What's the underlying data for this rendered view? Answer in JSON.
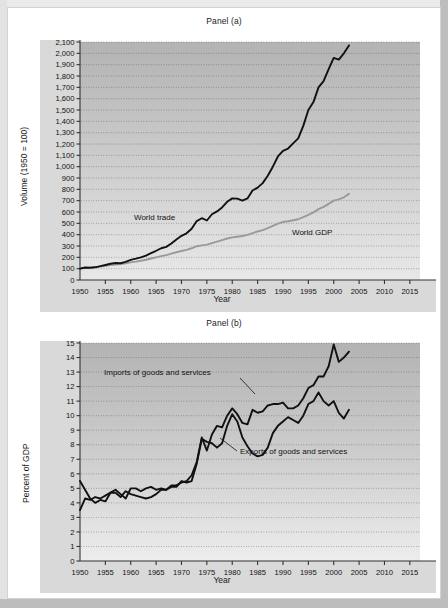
{
  "figure": {
    "background_color": "#ffffff",
    "frame_color": "#c9c9c9"
  },
  "panel_a": {
    "title": "Panel (a)",
    "ylabel": "Volume (1950 = 100)",
    "xlabel": "Year",
    "series_labels": {
      "world_trade": "World trade",
      "world_gdp": "World GDP"
    },
    "colors": {
      "world_trade": "#111111",
      "world_gdp": "#9a9a9a",
      "plot_bg_top": "#b3b3b3",
      "plot_bg_bottom": "#e8e8e8",
      "gridline": "#555555"
    },
    "ytick_labels": [
      "0",
      "100",
      "200",
      "300",
      "400",
      "500",
      "600",
      "700",
      "800",
      "900",
      "1,000",
      "1,100",
      "1,200",
      "1,300",
      "1,400",
      "1,500",
      "1,600",
      "1,700",
      "1,800",
      "1,900",
      "2,000",
      "2,100"
    ],
    "xtick_labels": [
      "1950",
      "1955",
      "1960",
      "1965",
      "1970",
      "1975",
      "1980",
      "1985",
      "1990",
      "1995",
      "2000",
      "2005",
      "2010",
      "2015"
    ]
  },
  "panel_b": {
    "title": "Panel (b)",
    "ylabel": "Percent of GDP",
    "xlabel": "Year",
    "series_labels": {
      "imports": "Imports of goods and services",
      "exports": "Exports of goods and services"
    },
    "colors": {
      "imports": "#111111",
      "exports": "#111111",
      "plot_bg_top": "#b3b3b3",
      "plot_bg_bottom": "#ededed",
      "gridline": "#555555"
    },
    "ytick_labels": [
      "0",
      "1",
      "2",
      "3",
      "4",
      "5",
      "6",
      "7",
      "8",
      "9",
      "10",
      "11",
      "12",
      "13",
      "14",
      "15"
    ],
    "xtick_labels": [
      "1950",
      "1955",
      "1960",
      "1965",
      "1970",
      "1975",
      "1980",
      "1985",
      "1990",
      "1995",
      "2000",
      "2005",
      "2010",
      "2015"
    ]
  },
  "chart_data": [
    {
      "type": "line",
      "id": "panel_a",
      "title": "Panel (a)",
      "xlabel": "Year",
      "ylabel": "Volume (1950 = 100)",
      "xlim": [
        1950,
        2017
      ],
      "ylim": [
        0,
        2100
      ],
      "ytick_step": 100,
      "xtick_step": 5,
      "grid": "horizontal-dotted",
      "legend": "inline-annotations",
      "x": [
        1950,
        1951,
        1952,
        1953,
        1954,
        1955,
        1956,
        1957,
        1958,
        1959,
        1960,
        1961,
        1962,
        1963,
        1964,
        1965,
        1966,
        1967,
        1968,
        1969,
        1970,
        1971,
        1972,
        1973,
        1974,
        1975,
        1976,
        1977,
        1978,
        1979,
        1980,
        1981,
        1982,
        1983,
        1984,
        1985,
        1986,
        1987,
        1988,
        1989,
        1990,
        1991,
        1992,
        1993,
        1994,
        1995,
        1996,
        1997,
        1998,
        1999,
        2000,
        2001,
        2002,
        2003
      ],
      "series": [
        {
          "name": "World trade",
          "color": "#111111",
          "values": [
            100,
            110,
            108,
            112,
            122,
            132,
            143,
            150,
            148,
            160,
            178,
            188,
            200,
            215,
            238,
            258,
            280,
            292,
            322,
            358,
            390,
            412,
            452,
            520,
            545,
            525,
            580,
            605,
            640,
            690,
            720,
            718,
            700,
            720,
            790,
            815,
            855,
            920,
            1000,
            1090,
            1140,
            1160,
            1205,
            1250,
            1360,
            1500,
            1570,
            1700,
            1755,
            1860,
            1960,
            1945,
            2000,
            2070
          ]
        },
        {
          "name": "World GDP",
          "color": "#9a9a9a",
          "values": [
            100,
            105,
            109,
            114,
            118,
            125,
            131,
            136,
            140,
            147,
            155,
            162,
            170,
            179,
            190,
            200,
            211,
            219,
            232,
            245,
            256,
            266,
            280,
            298,
            306,
            312,
            325,
            338,
            352,
            366,
            376,
            382,
            388,
            398,
            414,
            428,
            440,
            457,
            478,
            498,
            512,
            518,
            527,
            536,
            555,
            575,
            597,
            625,
            645,
            672,
            700,
            712,
            730,
            760
          ]
        }
      ]
    },
    {
      "type": "line",
      "id": "panel_b",
      "title": "Panel (b)",
      "xlabel": "Year",
      "ylabel": "Percent of GDP",
      "xlim": [
        1950,
        2017
      ],
      "ylim": [
        0,
        15
      ],
      "ytick_step": 1,
      "xtick_step": 5,
      "grid": "horizontal-dotted",
      "legend": "inline-annotations",
      "x": [
        1950,
        1951,
        1952,
        1953,
        1954,
        1955,
        1956,
        1957,
        1958,
        1959,
        1960,
        1961,
        1962,
        1963,
        1964,
        1965,
        1966,
        1967,
        1968,
        1969,
        1970,
        1971,
        1972,
        1973,
        1974,
        1975,
        1976,
        1977,
        1978,
        1979,
        1980,
        1981,
        1982,
        1983,
        1984,
        1985,
        1986,
        1987,
        1988,
        1989,
        1990,
        1991,
        1992,
        1993,
        1994,
        1995,
        1996,
        1997,
        1998,
        1999,
        2000,
        2001,
        2002,
        2003
      ],
      "series": [
        {
          "name": "Imports of goods and services",
          "color": "#111111",
          "values": [
            3.5,
            4.3,
            4.2,
            4.4,
            4.3,
            4.5,
            4.7,
            4.7,
            4.4,
            4.8,
            4.6,
            4.5,
            4.4,
            4.3,
            4.4,
            4.6,
            4.9,
            4.9,
            5.2,
            5.2,
            5.4,
            5.5,
            5.9,
            6.8,
            8.5,
            7.6,
            8.7,
            9.3,
            9.2,
            10.0,
            10.5,
            10.1,
            9.5,
            9.4,
            10.4,
            10.2,
            10.3,
            10.7,
            10.8,
            10.8,
            10.9,
            10.5,
            10.5,
            10.7,
            11.2,
            11.9,
            12.1,
            12.7,
            12.7,
            13.4,
            14.9,
            13.7,
            14.0,
            14.4
          ]
        },
        {
          "name": "Exports of goods and services",
          "color": "#111111",
          "values": [
            5.5,
            4.9,
            4.3,
            4.0,
            4.2,
            4.1,
            4.7,
            4.9,
            4.6,
            4.3,
            5.0,
            5.0,
            4.8,
            5.0,
            5.1,
            4.9,
            5.0,
            4.9,
            5.1,
            5.1,
            5.5,
            5.4,
            5.5,
            6.7,
            8.4,
            8.2,
            8.1,
            7.8,
            8.1,
            9.3,
            10.1,
            9.6,
            8.5,
            7.9,
            7.4,
            7.2,
            7.3,
            7.8,
            8.8,
            9.3,
            9.6,
            9.9,
            9.7,
            9.5,
            10.0,
            10.8,
            11.0,
            11.6,
            11.0,
            10.7,
            11.0,
            10.2,
            9.8,
            10.4
          ]
        }
      ]
    }
  ]
}
